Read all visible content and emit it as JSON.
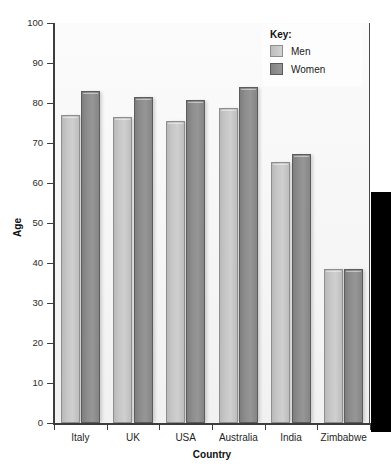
{
  "chart_data": {
    "type": "bar",
    "title": "",
    "xlabel": "Country",
    "ylabel": "Age",
    "categories": [
      "Italy",
      "UK",
      "USA",
      "Australia",
      "India",
      "Zimbabwe"
    ],
    "series": [
      {
        "name": "Men",
        "values": [
          77.0,
          76.5,
          75.5,
          78.7,
          65.2,
          38.6
        ]
      },
      {
        "name": "Women",
        "values": [
          83.0,
          81.5,
          80.8,
          84.0,
          67.3,
          38.6
        ]
      }
    ],
    "ylim": [
      0,
      100
    ],
    "yticks": [
      0,
      10,
      20,
      30,
      40,
      50,
      60,
      70,
      80,
      90,
      100
    ],
    "ytick_labels": [
      "0",
      "10",
      "20",
      "30",
      "40",
      "50",
      "60",
      "70",
      "80",
      "90",
      "100"
    ],
    "grid": false,
    "legend_position": "top-right",
    "legend_title": "Key:",
    "colors": {
      "men": "#c6c6c6",
      "men_border": "#8e8e8e",
      "women": "#8d8d8d",
      "women_border": "#5c5c5c",
      "axis": "#3d3d3d",
      "plot_background": "#f6f6f6",
      "page_background": "#ffffff",
      "occluder": "#000000"
    }
  },
  "legend": {
    "title": "Key:",
    "entries": [
      {
        "label": "Men",
        "swatch": "men-swatch"
      },
      {
        "label": "Women",
        "swatch": "women-swatch"
      }
    ]
  },
  "axes": {
    "y_title": "Age",
    "x_title": "Country"
  },
  "title_strip": ""
}
